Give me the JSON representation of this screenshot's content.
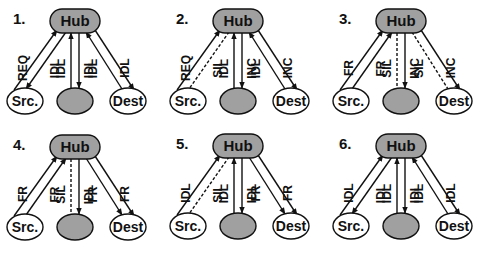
{
  "figure": {
    "colors": {
      "hub_fill": "#a0a0a0",
      "gray_node_fill": "#a0a0a0",
      "white_node_fill": "#ffffff",
      "stroke": "#111111"
    },
    "node_labels": {
      "hub": "Hub",
      "src": "Src.",
      "mid": "",
      "dest": "Dest"
    },
    "panels": [
      {
        "number": "1.",
        "ox": 0,
        "oy": 0,
        "edges": [
          {
            "from": "src",
            "to": "hub",
            "style": "solid",
            "side": "left",
            "label": "REQ"
          },
          {
            "from": "hub",
            "to": "src",
            "style": "solid",
            "side": "right",
            "label": "IDL"
          },
          {
            "from": "mid",
            "to": "hub",
            "style": "solid",
            "side": "left",
            "label": "IDL"
          },
          {
            "from": "hub",
            "to": "mid",
            "style": "solid",
            "side": "right",
            "label": "IDL"
          },
          {
            "from": "dest",
            "to": "hub",
            "style": "solid",
            "side": "left",
            "label": "IDL"
          },
          {
            "from": "hub",
            "to": "dest",
            "style": "solid",
            "side": "right",
            "label": "IDL"
          }
        ]
      },
      {
        "number": "2.",
        "ox": 163,
        "oy": 0,
        "edges": [
          {
            "from": "src",
            "to": "hub",
            "style": "solid",
            "side": "left",
            "label": "REQ"
          },
          {
            "from": "hub",
            "to": "src",
            "style": "dashed",
            "side": "right",
            "label": "SIL"
          },
          {
            "from": "mid",
            "to": "hub",
            "style": "solid",
            "side": "left",
            "label": "IDL"
          },
          {
            "from": "hub",
            "to": "mid",
            "style": "solid",
            "side": "right",
            "label": "INC"
          },
          {
            "from": "dest",
            "to": "hub",
            "style": "solid",
            "side": "left",
            "label": "IDL"
          },
          {
            "from": "hub",
            "to": "dest",
            "style": "solid",
            "side": "right",
            "label": "INC"
          }
        ]
      },
      {
        "number": "3.",
        "ox": 326,
        "oy": 0,
        "edges": [
          {
            "from": "src",
            "to": "hub",
            "style": "solid",
            "side": "left",
            "label": "FR"
          },
          {
            "from": "src",
            "to": "hub",
            "style": "solid",
            "side": "right",
            "label": "FR"
          },
          {
            "from": "hub",
            "to": "mid",
            "style": "dashed",
            "side": "left",
            "label": "SIL"
          },
          {
            "from": "hub",
            "to": "mid",
            "style": "solid",
            "side": "right",
            "label": "INC"
          },
          {
            "from": "hub",
            "to": "dest",
            "style": "dashed",
            "side": "left",
            "label": "SIL"
          },
          {
            "from": "hub",
            "to": "dest",
            "style": "solid",
            "side": "right",
            "label": "INC"
          }
        ]
      },
      {
        "number": "4.",
        "ox": 0,
        "oy": 126,
        "edges": [
          {
            "from": "src",
            "to": "hub",
            "style": "solid",
            "side": "left",
            "label": "FR"
          },
          {
            "from": "src",
            "to": "hub",
            "style": "solid",
            "side": "right",
            "label": "FR"
          },
          {
            "from": "hub",
            "to": "mid",
            "style": "dashed",
            "side": "left",
            "label": "SIL"
          },
          {
            "from": "hub",
            "to": "mid",
            "style": "solid",
            "side": "right",
            "label": "IDL"
          },
          {
            "from": "hub",
            "to": "dest",
            "style": "solid",
            "side": "left",
            "label": "FR"
          },
          {
            "from": "hub",
            "to": "dest",
            "style": "solid",
            "side": "right",
            "label": "FR"
          }
        ]
      },
      {
        "number": "5.",
        "ox": 163,
        "oy": 125,
        "edges": [
          {
            "from": "src",
            "to": "hub",
            "style": "solid",
            "side": "left",
            "label": "IDL"
          },
          {
            "from": "hub",
            "to": "src",
            "style": "dashed",
            "side": "right",
            "label": "SIL"
          },
          {
            "from": "mid",
            "to": "hub",
            "style": "solid",
            "side": "left",
            "label": "IDL"
          },
          {
            "from": "hub",
            "to": "mid",
            "style": "solid",
            "side": "right",
            "label": "IDL"
          },
          {
            "from": "hub",
            "to": "dest",
            "style": "solid",
            "side": "left",
            "label": "FR"
          },
          {
            "from": "hub",
            "to": "dest",
            "style": "solid",
            "side": "right",
            "label": "FR"
          }
        ]
      },
      {
        "number": "6.",
        "ox": 326,
        "oy": 125,
        "edges": [
          {
            "from": "src",
            "to": "hub",
            "style": "solid",
            "side": "left",
            "label": "IDL"
          },
          {
            "from": "hub",
            "to": "src",
            "style": "solid",
            "side": "right",
            "label": "IDL"
          },
          {
            "from": "mid",
            "to": "hub",
            "style": "solid",
            "side": "left",
            "label": "IDL"
          },
          {
            "from": "hub",
            "to": "mid",
            "style": "solid",
            "side": "right",
            "label": "IDL"
          },
          {
            "from": "dest",
            "to": "hub",
            "style": "solid",
            "side": "left",
            "label": "IDL"
          },
          {
            "from": "hub",
            "to": "dest",
            "style": "solid",
            "side": "right",
            "label": "IDL"
          }
        ]
      }
    ]
  }
}
